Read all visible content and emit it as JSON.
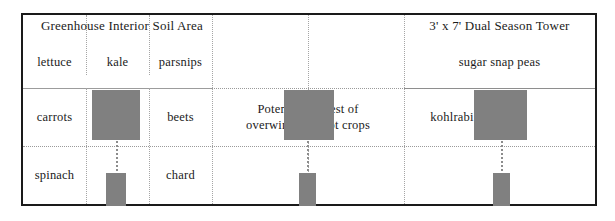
{
  "diagram": {
    "title_left": "Greenhouse Interior Soil Area",
    "title_right": "3' x 7' Dual Season Tower",
    "colors": {
      "bar_fill": "#808080",
      "frame": "#1a1a1a",
      "grid_dotted": "#9a9a9a",
      "text": "#1b1b1b",
      "background": "#ffffff"
    },
    "rows": [
      {
        "name": "top-row",
        "cells": [
          {
            "label": "lettuce"
          },
          {
            "label": "kale"
          },
          {
            "label": "parsnips"
          },
          {
            "label": ""
          },
          {
            "label": "sugar snap peas"
          }
        ]
      },
      {
        "name": "middle-row",
        "cells": [
          {
            "label": "carrots"
          },
          {
            "label": ""
          },
          {
            "label": "beets"
          },
          {
            "label": "Potential harvest of overwintered root crops"
          },
          {
            "label": "kohlrabi"
          }
        ]
      },
      {
        "name": "bottom-row",
        "cells": [
          {
            "label": "spinach"
          },
          {
            "label": ""
          },
          {
            "label": "chard"
          },
          {
            "label": ""
          },
          {
            "label": ""
          }
        ]
      }
    ],
    "annotation": {
      "line1": "Potential harvest of",
      "line2": "overwintered root crops"
    },
    "bars": [
      {
        "name": "large-bar-left",
        "row": "middle"
      },
      {
        "name": "large-bar-center",
        "row": "middle"
      },
      {
        "name": "large-bar-right",
        "row": "middle"
      },
      {
        "name": "small-bar-left",
        "row": "bottom"
      },
      {
        "name": "small-bar-center",
        "row": "bottom"
      },
      {
        "name": "small-bar-right",
        "row": "bottom"
      }
    ]
  }
}
